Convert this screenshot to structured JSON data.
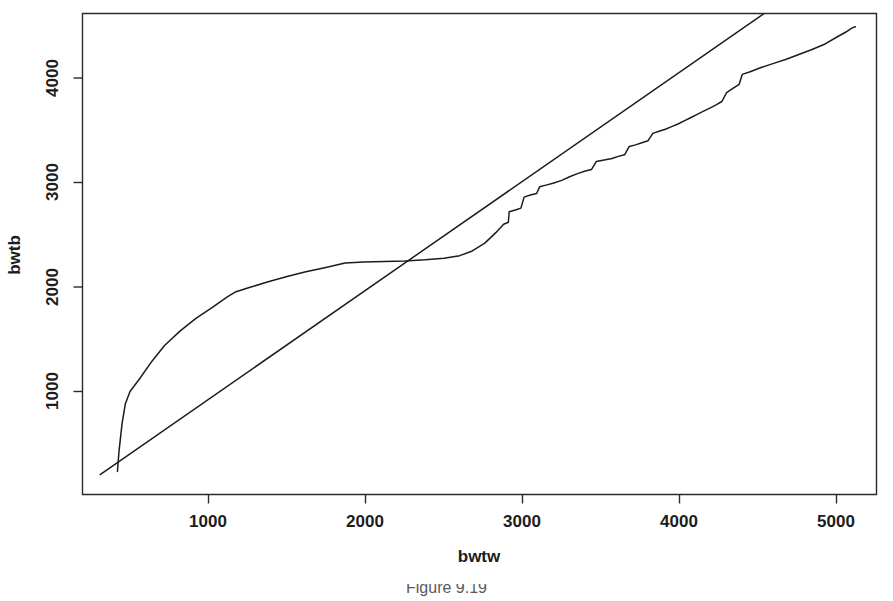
{
  "figure": {
    "caption": "Figure 9.19",
    "background_color": "#ffffff",
    "line_color": "#1c1c1c",
    "axis_color": "#2a2a2a"
  },
  "chart_data": {
    "type": "line",
    "title": "",
    "xlabel": "bwtw",
    "ylabel": "bwtb",
    "grid": false,
    "legend": "none",
    "xlim": [
      300,
      5200
    ],
    "ylim": [
      150,
      4650
    ],
    "xticks": [
      1000,
      2000,
      3000,
      4000,
      5000
    ],
    "xtick_labels": [
      "1000",
      "2000",
      "3000",
      "4000",
      "5000"
    ],
    "yticks": [
      1000,
      2000,
      3000,
      4000
    ],
    "ytick_labels": [
      "1000",
      "2000",
      "3000",
      "4000"
    ],
    "series": [
      {
        "name": "empirical-qq-step-curve",
        "style": "step-like polyline",
        "points": [
          [
            420,
            235
          ],
          [
            430,
            430
          ],
          [
            450,
            700
          ],
          [
            470,
            880
          ],
          [
            500,
            1000
          ],
          [
            560,
            1120
          ],
          [
            640,
            1290
          ],
          [
            720,
            1440
          ],
          [
            820,
            1580
          ],
          [
            920,
            1700
          ],
          [
            1020,
            1800
          ],
          [
            1120,
            1905
          ],
          [
            1175,
            1955
          ],
          [
            1260,
            1995
          ],
          [
            1380,
            2050
          ],
          [
            1500,
            2100
          ],
          [
            1620,
            2145
          ],
          [
            1740,
            2185
          ],
          [
            1870,
            2230
          ],
          [
            1990,
            2240
          ],
          [
            2120,
            2245
          ],
          [
            2250,
            2250
          ],
          [
            2380,
            2260
          ],
          [
            2500,
            2275
          ],
          [
            2600,
            2300
          ],
          [
            2680,
            2345
          ],
          [
            2760,
            2420
          ],
          [
            2830,
            2520
          ],
          [
            2880,
            2600
          ],
          [
            2910,
            2620
          ],
          [
            2915,
            2720
          ],
          [
            2960,
            2740
          ],
          [
            2990,
            2755
          ],
          [
            3010,
            2860
          ],
          [
            3050,
            2880
          ],
          [
            3090,
            2895
          ],
          [
            3110,
            2960
          ],
          [
            3150,
            2975
          ],
          [
            3200,
            2995
          ],
          [
            3250,
            3020
          ],
          [
            3300,
            3055
          ],
          [
            3350,
            3085
          ],
          [
            3400,
            3110
          ],
          [
            3440,
            3125
          ],
          [
            3470,
            3200
          ],
          [
            3520,
            3215
          ],
          [
            3570,
            3230
          ],
          [
            3610,
            3250
          ],
          [
            3650,
            3265
          ],
          [
            3680,
            3345
          ],
          [
            3720,
            3360
          ],
          [
            3760,
            3380
          ],
          [
            3800,
            3400
          ],
          [
            3830,
            3470
          ],
          [
            3870,
            3490
          ],
          [
            3910,
            3510
          ],
          [
            3950,
            3535
          ],
          [
            3990,
            3560
          ],
          [
            4030,
            3590
          ],
          [
            4070,
            3620
          ],
          [
            4110,
            3650
          ],
          [
            4150,
            3680
          ],
          [
            4190,
            3710
          ],
          [
            4230,
            3740
          ],
          [
            4270,
            3775
          ],
          [
            4300,
            3860
          ],
          [
            4340,
            3900
          ],
          [
            4380,
            3940
          ],
          [
            4400,
            4035
          ],
          [
            4450,
            4060
          ],
          [
            4520,
            4100
          ],
          [
            4600,
            4140
          ],
          [
            4680,
            4180
          ],
          [
            4760,
            4225
          ],
          [
            4840,
            4270
          ],
          [
            4920,
            4320
          ],
          [
            5000,
            4390
          ],
          [
            5060,
            4440
          ],
          [
            5100,
            4480
          ],
          [
            5120,
            4490
          ]
        ]
      },
      {
        "name": "reference-diagonal-line",
        "style": "straight line",
        "points": [
          [
            310,
            205
          ],
          [
            4580,
            4660
          ]
        ]
      }
    ],
    "annotations": []
  },
  "axes": {
    "x_title": "bwtw",
    "y_title": "bwtb"
  }
}
